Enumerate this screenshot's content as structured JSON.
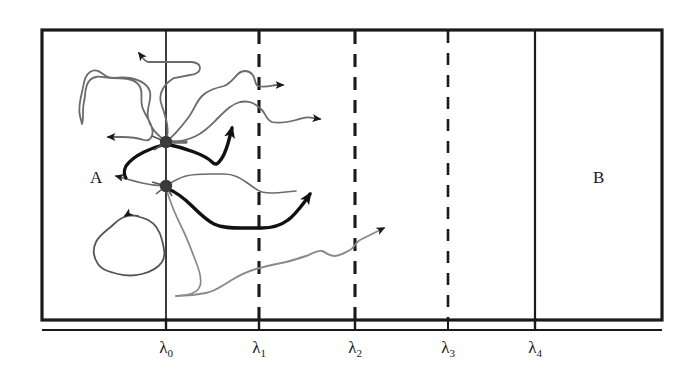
{
  "figure": {
    "kind": "milestoning-trajectory-diagram",
    "background_color": "#ffffff",
    "line_color": "#1a1a1a",
    "thin_trajectory_color": "#666666",
    "bold_trajectory_color": "#111111",
    "node_color": "#333333",
    "frame": {
      "x": 42,
      "y": 30,
      "width": 620,
      "height": 290,
      "stroke_width": 3
    },
    "regions": [
      {
        "id": "A",
        "label": "A",
        "label_x": 98,
        "label_y": 178
      },
      {
        "id": "B",
        "label": "B",
        "label_x": 600,
        "label_y": 178
      }
    ],
    "milestones": [
      {
        "label": "λ",
        "sub": "0",
        "x": 166,
        "style": "solid",
        "tick": "long"
      },
      {
        "label": "λ",
        "sub": "1",
        "x": 259,
        "style": "dashed",
        "tick": "short"
      },
      {
        "label": "λ",
        "sub": "2",
        "x": 355,
        "style": "dashed",
        "tick": "short"
      },
      {
        "label": "λ",
        "sub": "3",
        "x": 448,
        "style": "dashed",
        "tick": "short"
      },
      {
        "label": "λ",
        "sub": "4",
        "x": 535,
        "style": "solid",
        "tick": "long"
      }
    ],
    "axis": {
      "y": 330,
      "x_start": 42,
      "x_end": 662,
      "stroke_width": 2,
      "label_y": 340
    },
    "nodes": [
      {
        "id": "node-upper",
        "x": 166,
        "y": 142,
        "r": 6
      },
      {
        "id": "node-lower",
        "x": 166,
        "y": 186,
        "r": 6
      }
    ],
    "trajectories": [
      {
        "id": "traj-return-upleft",
        "weight": "thin",
        "description": "from upper node up and left, recrossing lambda0, arrow pointing left",
        "arrow": {
          "x": 132,
          "y": 50,
          "dir": "left"
        }
      },
      {
        "id": "traj-loop-left",
        "weight": "thin",
        "description": "wandering excursion left of lambda0 returning, arrow pointing left",
        "arrow": {
          "x": 104,
          "y": 137,
          "dir": "left"
        }
      },
      {
        "id": "traj-exit-right-1",
        "weight": "thin",
        "description": "from upper node rightwards crossing lambda1, arrow pointing right",
        "arrow": {
          "x": 291,
          "y": 85,
          "dir": "right"
        }
      },
      {
        "id": "traj-exit-right-2",
        "weight": "thin",
        "description": "from upper node rising rightwards, arrow pointing right",
        "arrow": {
          "x": 328,
          "y": 120,
          "dir": "right"
        }
      },
      {
        "id": "traj-bold-up",
        "weight": "bold",
        "description": "bold path from upper node dipping then rising, arrow pointing up-right",
        "arrow": {
          "x": 238,
          "y": 117,
          "dir": "up-right"
        }
      },
      {
        "id": "traj-return-lower",
        "weight": "thin",
        "description": "from lower node leftwards recrossing lambda0, arrow pointing left",
        "arrow": {
          "x": 112,
          "y": 176,
          "dir": "left"
        }
      },
      {
        "id": "traj-closed-loop",
        "weight": "thin",
        "description": "closed wandering loop entirely inside region A, arrow pointing up-right",
        "arrow": {
          "x": 123,
          "y": 213,
          "dir": "up-right"
        }
      },
      {
        "id": "traj-bold-lower",
        "weight": "bold",
        "description": "bold path from lower node dipping then rising past lambda1, arrow pointing up-right",
        "arrow": {
          "x": 315,
          "y": 188,
          "dir": "up-right"
        }
      },
      {
        "id": "traj-long-lower",
        "weight": "thin",
        "description": "long low excursion sweeping right past lambda2, arrow pointing up-right",
        "arrow": {
          "x": 392,
          "y": 222,
          "dir": "up-right"
        }
      },
      {
        "id": "traj-down-from-node",
        "weight": "thin",
        "description": "descends from lower node to the bottom excursion",
        "arrow": null
      }
    ]
  }
}
